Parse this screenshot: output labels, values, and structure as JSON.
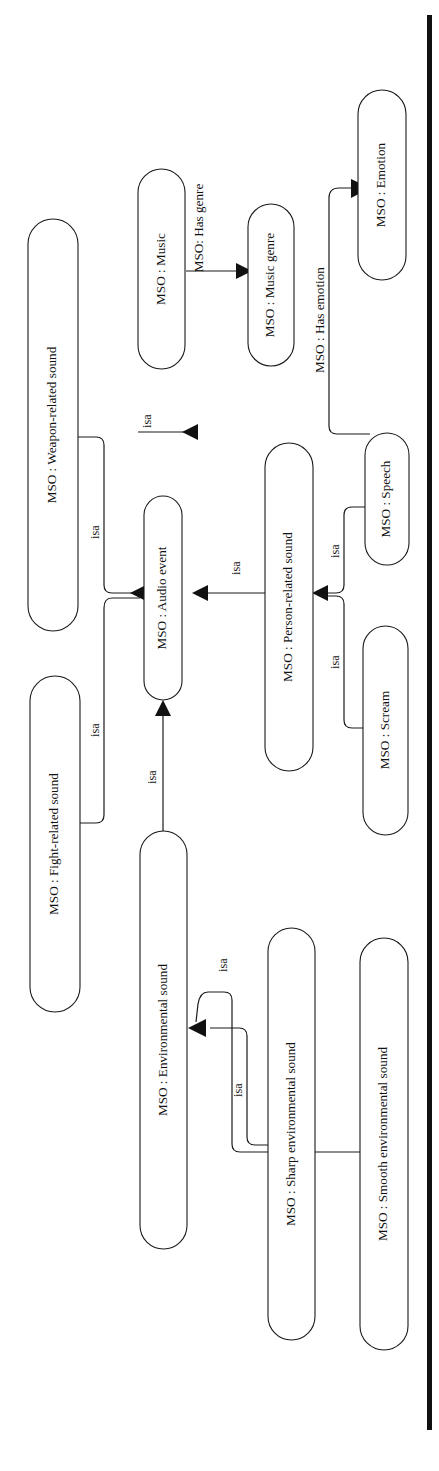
{
  "figure": {
    "kind": "ontology-class-diagram",
    "orientation": "rotated-90-ccw",
    "background_color": "#ffffff",
    "node_fill": "#ffffff",
    "node_stroke": "#1a1a1a",
    "text_color": "#111111"
  },
  "nodes": [
    {
      "id": "audio-event",
      "label": "MSO : Audio event"
    },
    {
      "id": "music",
      "label": "MSO : Music"
    },
    {
      "id": "music-genre",
      "label": "MSO : Music genre"
    },
    {
      "id": "emotion",
      "label": "MSO : Emotion"
    },
    {
      "id": "weapon-related",
      "label": "MSO : Weapon-related sound"
    },
    {
      "id": "fight-related",
      "label": "MSO : Fight-related sound"
    },
    {
      "id": "person-related",
      "label": "MSO : Person-related sound"
    },
    {
      "id": "speech",
      "label": "MSO : Speech"
    },
    {
      "id": "scream",
      "label": "MSO : Scream"
    },
    {
      "id": "environmental",
      "label": "MSO : Environmental sound"
    },
    {
      "id": "sharp-env",
      "label": "MSO : Sharp environmental sound"
    },
    {
      "id": "smooth-env",
      "label": "MSO : Smooth environmental sound"
    }
  ],
  "edges": [
    {
      "id": "e-music-isa",
      "from": "music",
      "to": "audio-event",
      "label": "isa"
    },
    {
      "id": "e-weapon-isa",
      "from": "weapon-related",
      "to": "audio-event",
      "label": "isa"
    },
    {
      "id": "e-fight-isa",
      "from": "fight-related",
      "to": "audio-event",
      "label": "isa"
    },
    {
      "id": "e-person-isa",
      "from": "person-related",
      "to": "audio-event",
      "label": "isa"
    },
    {
      "id": "e-environmental-isa",
      "from": "environmental",
      "to": "audio-event",
      "label": "isa"
    },
    {
      "id": "e-speech-isa",
      "from": "speech",
      "to": "person-related",
      "label": "isa"
    },
    {
      "id": "e-scream-isa",
      "from": "scream",
      "to": "person-related",
      "label": "isa"
    },
    {
      "id": "e-sharp-isa",
      "from": "sharp-env",
      "to": "environmental",
      "label": "isa"
    },
    {
      "id": "e-smooth-isa",
      "from": "smooth-env",
      "to": "environmental",
      "label": "isa"
    },
    {
      "id": "e-has-genre",
      "from": "music",
      "to": "music-genre",
      "label": "MSO: Has genre"
    },
    {
      "id": "e-has-emotion",
      "from": "speech",
      "to": "emotion",
      "label": "MSO : Has emotion"
    }
  ]
}
